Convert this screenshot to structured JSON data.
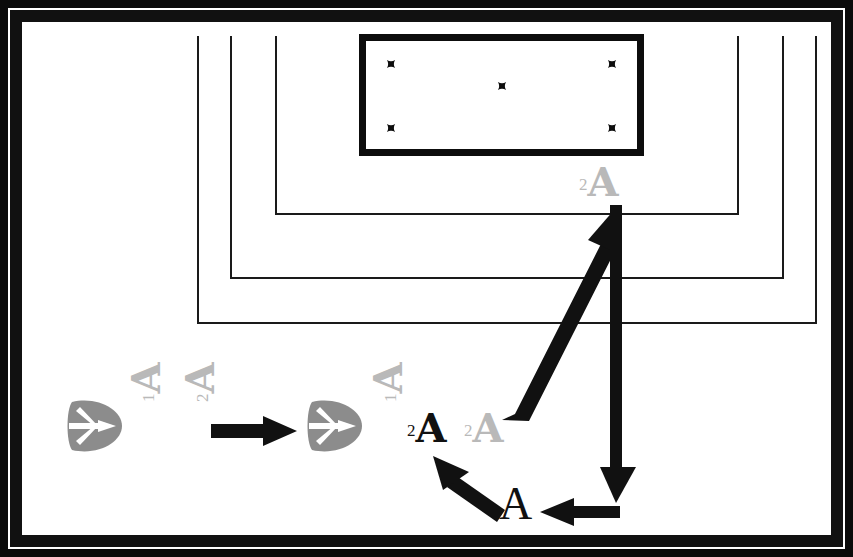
{
  "figure": {
    "background_color": "#ffffff",
    "frame_color": "#0a0a0a",
    "ink_black": "#111111",
    "ink_gray": "#b9b9b9"
  },
  "crest_box": {
    "border_color": "#0d0d0d",
    "crosses": [
      {
        "name": "cross-top-left",
        "symbol": "maltese-cross"
      },
      {
        "name": "cross-top-right",
        "symbol": "maltese-cross"
      },
      {
        "name": "cross-center",
        "symbol": "maltese-cross"
      },
      {
        "name": "cross-bottom-left",
        "symbol": "maltese-cross"
      },
      {
        "name": "cross-bottom-right",
        "symbol": "maltese-cross"
      }
    ],
    "cross_count": 5
  },
  "nested_frames": [
    {
      "name": "frame-outer",
      "stroke": "#1a1a1a"
    },
    {
      "name": "frame-middle",
      "stroke": "#1a1a1a"
    },
    {
      "name": "frame-inner",
      "stroke": "#1a1a1a"
    }
  ],
  "labels": {
    "crest_label": {
      "sup": "2",
      "letter": "A",
      "color": "#b9b9b9"
    },
    "source_label_1": {
      "sup": "1",
      "letter": "A",
      "color": "#b9b9b9"
    },
    "source_label_2": {
      "sup": "2",
      "letter": "A",
      "color": "#b9b9b9"
    },
    "result_label_1": {
      "sup": "1",
      "letter": "A",
      "color": "#b9b9b9"
    },
    "result_label_2": {
      "sup": "2",
      "letter": "A",
      "color": "#111111"
    },
    "result_label_3": {
      "sup": "2",
      "letter": "A",
      "color": "#b9b9b9"
    },
    "point_a": {
      "text": "A",
      "color": "#111111"
    }
  },
  "marks": {
    "leaf_left": {
      "name": "leaf-star-mark-left",
      "fill": "#8c8c8c"
    },
    "leaf_right": {
      "name": "leaf-star-mark-right",
      "fill": "#8c8c8c"
    }
  },
  "arrows": [
    {
      "name": "transform-arrow",
      "direction": "right",
      "color": "#111111"
    },
    {
      "name": "long-diagonal-arrow",
      "direction": "up-right",
      "color": "#111111"
    },
    {
      "name": "vertical-down-arrow",
      "direction": "down",
      "color": "#111111"
    },
    {
      "name": "horizontal-left-arrow",
      "direction": "left",
      "color": "#111111"
    },
    {
      "name": "short-diagonal-arrow",
      "direction": "up-left",
      "color": "#111111"
    }
  ]
}
